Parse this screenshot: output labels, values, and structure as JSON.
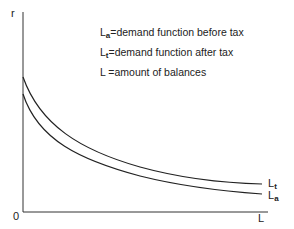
{
  "axes": {
    "y_label": "r",
    "x_label": "L",
    "origin_label": "0"
  },
  "legend": [
    {
      "symbol": "L",
      "sub": "a",
      "text": "=demand function before tax"
    },
    {
      "symbol": "L",
      "sub": "t",
      "text": "=demand function after tax"
    },
    {
      "symbol": "L",
      "sub": "",
      "text": " =amount of balances"
    }
  ],
  "curve_labels": {
    "upper": {
      "symbol": "L",
      "sub": "t"
    },
    "lower": {
      "symbol": "L",
      "sub": "a"
    }
  },
  "colors": {
    "line": "#222222",
    "background": "#ffffff"
  }
}
